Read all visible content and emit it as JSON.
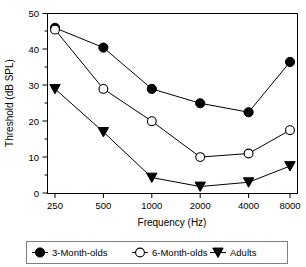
{
  "chart_data": {
    "type": "line",
    "title": "",
    "xlabel": "Frequency (Hz)",
    "ylabel": "Threshold (dB SPL)",
    "categories": [
      "250",
      "500",
      "1000",
      "2000",
      "4000",
      "8000"
    ],
    "x_tick_labels": [
      "250",
      "500",
      "1000",
      "2000",
      "4000",
      "8000"
    ],
    "y_tick_labels": [
      "0",
      "10",
      "20",
      "30",
      "40",
      "50"
    ],
    "y_ticks": [
      0,
      10,
      20,
      30,
      40,
      50
    ],
    "ylim": [
      0,
      50
    ],
    "grid": false,
    "legend_position": "below-outside",
    "series": [
      {
        "name": "3-Month-olds",
        "marker": "filled-circle",
        "color": "#000000",
        "values": [
          46,
          40.5,
          29,
          25,
          22.5,
          36.5
        ]
      },
      {
        "name": "6-Month-olds",
        "marker": "open-circle",
        "color": "#000000",
        "values": [
          45.5,
          29,
          20,
          10,
          11,
          17.5
        ]
      },
      {
        "name": "Adults",
        "marker": "filled-triangle-down",
        "color": "#000000",
        "values": [
          29,
          17,
          4.3,
          1.8,
          3,
          7.5
        ]
      }
    ]
  },
  "legend": {
    "items": [
      {
        "label": "3-Month-olds",
        "marker": "filled-circle"
      },
      {
        "label": "6-Month-olds",
        "marker": "open-circle"
      },
      {
        "label": "Adults",
        "marker": "filled-triangle-down"
      }
    ]
  },
  "axes": {
    "x_title": "Frequency (Hz)",
    "y_title": "Threshold (dB SPL)"
  }
}
